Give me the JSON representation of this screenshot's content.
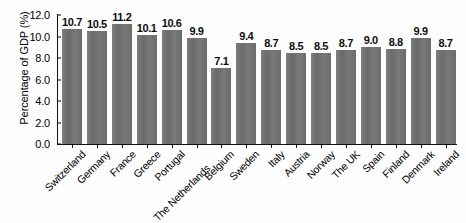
{
  "chart_data": {
    "type": "bar",
    "title": "",
    "xlabel": "",
    "ylabel": "Percentage of GDP (%)",
    "ylim": [
      0.0,
      12.0
    ],
    "ytick_labels": [
      "0.0",
      "2.0",
      "4.0",
      "6.0",
      "8.0",
      "10.0",
      "12.0"
    ],
    "ytick_values": [
      0.0,
      2.0,
      4.0,
      6.0,
      8.0,
      10.0,
      12.0
    ],
    "grid": false,
    "legend": "none",
    "bar_color": "#707070",
    "axis_color": "#111111",
    "background_color": "#fdfdfd",
    "value_labels_shown": true,
    "xtick_label_rotation": -45,
    "categories": [
      "Switzerland",
      "Germany",
      "France",
      "Greece",
      "Portugal",
      "The Netherlands",
      "Belgium",
      "Sweden",
      "Italy",
      "Austria",
      "Norway",
      "The UK",
      "Spain",
      "Finland",
      "Denmark",
      "Ireland"
    ],
    "values": [
      10.7,
      10.5,
      11.2,
      10.1,
      10.6,
      9.9,
      7.1,
      9.4,
      8.7,
      8.5,
      8.5,
      8.7,
      9.0,
      8.8,
      9.9,
      8.7
    ],
    "value_labels": [
      "10.7",
      "10.5",
      "11.2",
      "10.1",
      "10.6",
      "9.9",
      "7.1",
      "9.4",
      "8.7",
      "8.5",
      "8.5",
      "8.7",
      "9.0",
      "8.8",
      "9.9",
      "8.7"
    ],
    "staggered_label_indices": [
      5
    ]
  }
}
